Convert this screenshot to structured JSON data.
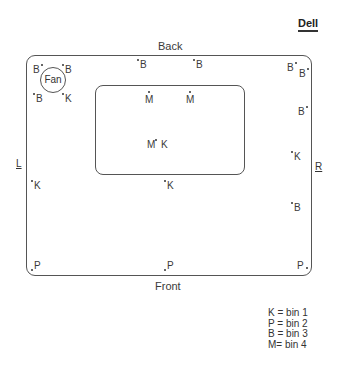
{
  "title": "Dell",
  "labels": {
    "back": "Back",
    "front": "Front",
    "left": "L",
    "right": "R",
    "fan": "Fan"
  },
  "markers": [
    {
      "id": "m1",
      "letter": "B",
      "x": 33,
      "y": 65,
      "dot": "after"
    },
    {
      "id": "m2",
      "letter": "B",
      "x": 65,
      "y": 65,
      "dot": "before"
    },
    {
      "id": "m3",
      "letter": "B",
      "x": 36,
      "y": 94,
      "dot": "before"
    },
    {
      "id": "m4",
      "letter": "K",
      "x": 65,
      "y": 94,
      "dot": "before"
    },
    {
      "id": "m5",
      "letter": "B",
      "x": 140,
      "y": 60,
      "dot": "before"
    },
    {
      "id": "m6",
      "letter": "B",
      "x": 196,
      "y": 60,
      "dot": "before"
    },
    {
      "id": "m7",
      "letter": "B",
      "x": 287,
      "y": 63,
      "dot": "after"
    },
    {
      "id": "m8",
      "letter": "B",
      "x": 299,
      "y": 69,
      "dot": "after"
    },
    {
      "id": "m9",
      "letter": "M",
      "x": 145,
      "y": 95,
      "dot": "above"
    },
    {
      "id": "m10",
      "letter": "M",
      "x": 186,
      "y": 95,
      "dot": "above"
    },
    {
      "id": "m11",
      "letter": "B",
      "x": 298,
      "y": 107,
      "dot": "after"
    },
    {
      "id": "m12",
      "letter": "M",
      "x": 147,
      "y": 140,
      "dot": "after"
    },
    {
      "id": "m13",
      "letter": "K",
      "x": 161,
      "y": 140,
      "dot": "none"
    },
    {
      "id": "m14",
      "letter": "K",
      "x": 294,
      "y": 152,
      "dot": "before"
    },
    {
      "id": "m15",
      "letter": "K",
      "x": 34,
      "y": 181,
      "dot": "before"
    },
    {
      "id": "m16",
      "letter": "K",
      "x": 167,
      "y": 181,
      "dot": "before"
    },
    {
      "id": "m17",
      "letter": "B",
      "x": 294,
      "y": 203,
      "dot": "before"
    },
    {
      "id": "m18",
      "letter": "P",
      "x": 34,
      "y": 261,
      "dot": "before-low"
    },
    {
      "id": "m19",
      "letter": "P",
      "x": 167,
      "y": 261,
      "dot": "before-low"
    },
    {
      "id": "m20",
      "letter": "P",
      "x": 297,
      "y": 261,
      "dot": "after-low"
    }
  ],
  "legend": [
    {
      "key": "K",
      "text": "K = bin 1"
    },
    {
      "key": "P",
      "text": "P = bin 2"
    },
    {
      "key": "B",
      "text": "B = bin 3"
    },
    {
      "key": "M",
      "text": "M= bin 4"
    }
  ]
}
